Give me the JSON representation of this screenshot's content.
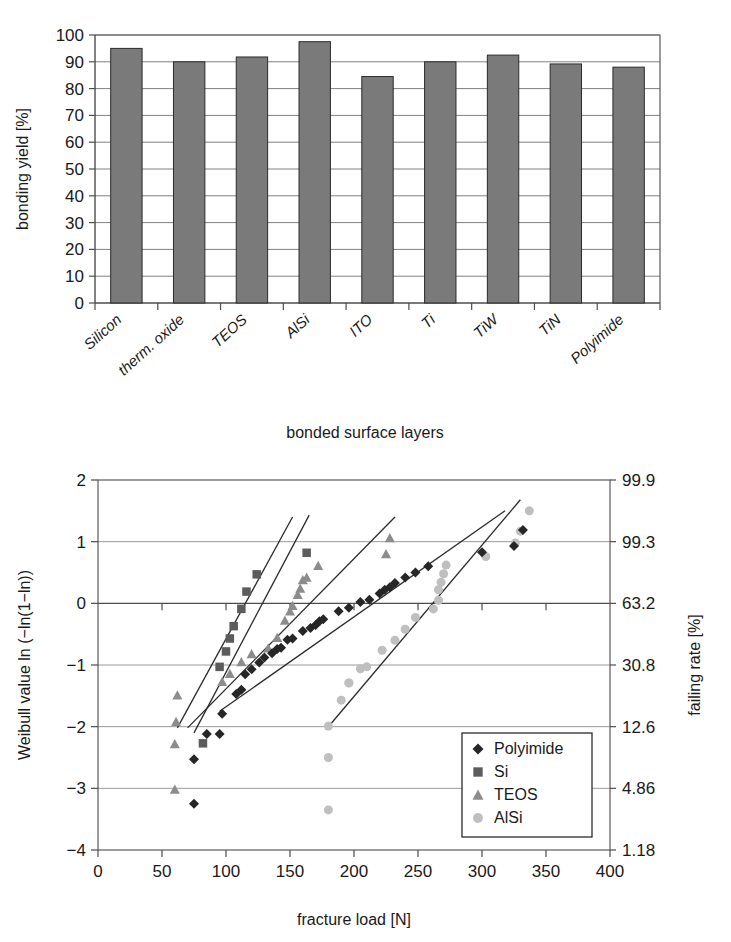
{
  "chart_data": [
    {
      "type": "bar",
      "title": "",
      "xlabel": "bonded surface layers",
      "ylabel": "bonding yield [%]",
      "categories": [
        "Silicon",
        "therm. oxide",
        "TEOS",
        "AlSi",
        "ITO",
        "Ti",
        "TiW",
        "TiN",
        "Polyimide"
      ],
      "values": [
        95.0,
        90.0,
        91.8,
        97.5,
        84.5,
        90.0,
        92.5,
        89.2,
        88.0
      ],
      "ylim": [
        0,
        100
      ],
      "yticks": [
        0,
        10,
        20,
        30,
        40,
        50,
        60,
        70,
        80,
        90,
        100
      ],
      "grid": true,
      "legend": "none",
      "bar_color": "#7a7a7a"
    },
    {
      "type": "scatter",
      "title": "",
      "xlabel": "fracture load [N]",
      "ylabel": "Weibull value ln (−ln(1−ln))",
      "ylabel_right": "failing rate [%]",
      "xlim": [
        0,
        400
      ],
      "ylim": [
        -4,
        2
      ],
      "xticks": [
        0,
        50,
        100,
        150,
        200,
        250,
        300,
        350,
        400
      ],
      "yticks": [
        -4,
        -3,
        -2,
        -1,
        0,
        1,
        2
      ],
      "yticks_right_labels": [
        "1.18",
        "4.86",
        "12.6",
        "30.8",
        "63.2",
        "99.3",
        "99.9"
      ],
      "yticks_right_values": [
        -4,
        -3,
        -2,
        -1,
        0,
        1,
        2
      ],
      "grid": true,
      "legend_position": "lower-right",
      "series": [
        {
          "name": "Polyimide",
          "marker": "diamond",
          "color": "#262626",
          "points": [
            [
              75,
              -3.25
            ],
            [
              75,
              -2.53
            ],
            [
              85,
              -2.12
            ],
            [
              95,
              -2.12
            ],
            [
              97,
              -1.79
            ],
            [
              108,
              -1.47
            ],
            [
              112,
              -1.4
            ],
            [
              115,
              -1.15
            ],
            [
              120,
              -1.07
            ],
            [
              126,
              -0.96
            ],
            [
              130,
              -0.88
            ],
            [
              136,
              -0.81
            ],
            [
              140,
              -0.74
            ],
            [
              143,
              -0.72
            ],
            [
              148,
              -0.59
            ],
            [
              152,
              -0.57
            ],
            [
              160,
              -0.45
            ],
            [
              166,
              -0.4
            ],
            [
              170,
              -0.35
            ],
            [
              173,
              -0.29
            ],
            [
              176,
              -0.26
            ],
            [
              188,
              -0.13
            ],
            [
              196,
              -0.07
            ],
            [
              205,
              0.02
            ],
            [
              212,
              0.06
            ],
            [
              220,
              0.16
            ],
            [
              224,
              0.22
            ],
            [
              228,
              0.26
            ],
            [
              232,
              0.33
            ],
            [
              240,
              0.42
            ],
            [
              248,
              0.5
            ],
            [
              258,
              0.6
            ],
            [
              300,
              0.83
            ],
            [
              325,
              0.93
            ],
            [
              332,
              1.19
            ]
          ]
        },
        {
          "name": "Si",
          "marker": "square",
          "color": "#5c5c5c",
          "points": [
            [
              82,
              -2.27
            ],
            [
              95,
              -1.03
            ],
            [
              100,
              -0.78
            ],
            [
              103,
              -0.57
            ],
            [
              106,
              -0.37
            ],
            [
              112,
              -0.09
            ],
            [
              116,
              0.19
            ],
            [
              124,
              0.47
            ],
            [
              163,
              0.82
            ]
          ]
        },
        {
          "name": "TEOS",
          "marker": "triangle",
          "color": "#8c8c8c",
          "points": [
            [
              60,
              -3.02
            ],
            [
              60,
              -2.28
            ],
            [
              61,
              -1.92
            ],
            [
              62,
              -1.49
            ],
            [
              97,
              -1.27
            ],
            [
              103,
              -1.14
            ],
            [
              112,
              -0.95
            ],
            [
              120,
              -0.82
            ],
            [
              133,
              -0.73
            ],
            [
              140,
              -0.56
            ],
            [
              146,
              -0.28
            ],
            [
              150,
              -0.13
            ],
            [
              152,
              -0.04
            ],
            [
              156,
              0.14
            ],
            [
              158,
              0.24
            ],
            [
              160,
              0.38
            ],
            [
              163,
              0.42
            ],
            [
              172,
              0.61
            ],
            [
              225,
              0.8
            ],
            [
              228,
              1.06
            ]
          ]
        },
        {
          "name": "AlSi",
          "marker": "circle",
          "color": "#bfbfbf",
          "points": [
            [
              180,
              -3.35
            ],
            [
              180,
              -2.5
            ],
            [
              180,
              -1.99
            ],
            [
              190,
              -1.57
            ],
            [
              196,
              -1.29
            ],
            [
              196,
              -1.29
            ],
            [
              205,
              -1.06
            ],
            [
              210,
              -1.03
            ],
            [
              222,
              -0.76
            ],
            [
              232,
              -0.6
            ],
            [
              240,
              -0.42
            ],
            [
              248,
              -0.23
            ],
            [
              262,
              -0.09
            ],
            [
              266,
              0.05
            ],
            [
              266,
              0.22
            ],
            [
              268,
              0.34
            ],
            [
              270,
              0.48
            ],
            [
              272,
              0.62
            ],
            [
              303,
              0.76
            ],
            [
              326,
              0.98
            ],
            [
              330,
              1.17
            ],
            [
              337,
              1.5
            ]
          ]
        }
      ],
      "fit_lines": [
        {
          "for": "Si",
          "x1": 75,
          "y1": -2.1,
          "x2": 165,
          "y2": 1.43
        },
        {
          "for": "TEOS",
          "x1": 62,
          "y1": -2.02,
          "x2": 152,
          "y2": 1.4
        },
        {
          "for": "Polyimide",
          "x1": 70,
          "y1": -2.02,
          "x2": 232,
          "y2": 1.4
        },
        {
          "for": "AlSi",
          "x1": 178,
          "y1": -2.05,
          "x2": 330,
          "y2": 1.68
        },
        {
          "for": "Polyimide2",
          "x1": 95,
          "y1": -1.75,
          "x2": 318,
          "y2": 1.5
        }
      ]
    }
  ],
  "barchart": {
    "ylabel": "bonding yield [%]",
    "xlabel": "bonded surface layers",
    "yticks": [
      "0",
      "10",
      "20",
      "30",
      "40",
      "50",
      "60",
      "70",
      "80",
      "90",
      "100"
    ],
    "categories": [
      "Silicon",
      "therm. oxide",
      "TEOS",
      "AlSi",
      "ITO",
      "Ti",
      "TiW",
      "TiN",
      "Polyimide"
    ]
  },
  "weibull": {
    "ylabel_left": "Weibull value ln (−ln(1−ln))",
    "ylabel_right": "failing rate [%]",
    "xlabel": "fracture load [N]",
    "yticks_left": [
      "2",
      "1",
      "0",
      "−1",
      "−2",
      "−3",
      "−4"
    ],
    "yticks_right": [
      "99.9",
      "99.3",
      "63.2",
      "30.8",
      "12.6",
      "4.86",
      "1.18"
    ],
    "xticks": [
      "0",
      "50",
      "100",
      "150",
      "200",
      "250",
      "300",
      "350",
      "400"
    ],
    "legend_items": [
      "Polyimide",
      "Si",
      "TEOS",
      "AlSi"
    ]
  }
}
